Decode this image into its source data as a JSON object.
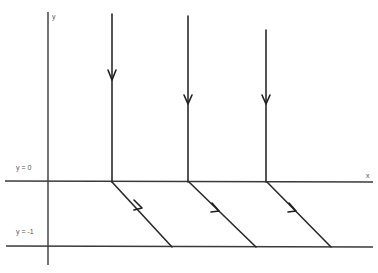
{
  "diagram": {
    "labels": {
      "y_axis": "y",
      "x_axis": "x",
      "upper_boundary": "y = 0",
      "lower_boundary": "y = -1"
    },
    "colors": {
      "line": "#2a2a2a",
      "background": "#ffffff"
    },
    "rays": [
      {
        "x": 112,
        "top": 14,
        "arrow_y": 82,
        "diag_end_x": 172
      },
      {
        "x": 188,
        "top": 16,
        "arrow_y": 82,
        "diag_end_x": 256
      },
      {
        "x": 266,
        "top": 30,
        "arrow_y": 82,
        "diag_end_x": 331
      }
    ]
  }
}
